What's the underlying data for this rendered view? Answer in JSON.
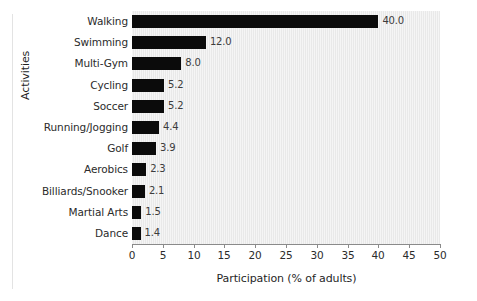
{
  "chart_data": {
    "type": "bar",
    "orientation": "horizontal",
    "title": "",
    "xlabel": "Participation (% of adults)",
    "ylabel": "Activities",
    "xlim": [
      0,
      50
    ],
    "xticks": [
      0,
      5,
      10,
      15,
      20,
      25,
      30,
      35,
      40,
      45,
      50
    ],
    "xtick_labels": [
      "0",
      "5",
      "10",
      "15",
      "20",
      "25",
      "30",
      "35",
      "40",
      "45",
      "50"
    ],
    "grid": false,
    "legend": null,
    "bar_color": "#0b0b0b",
    "plot_background": "#e9e9e9",
    "categories": [
      "Walking",
      "Swimming",
      "Multi-Gym",
      "Cycling",
      "Soccer",
      "Running/Jogging",
      "Golf",
      "Aerobics",
      "Billiards/Snooker",
      "Martial Arts",
      "Dance"
    ],
    "values": [
      40.0,
      12.0,
      8.0,
      5.2,
      5.2,
      4.4,
      3.9,
      2.3,
      2.1,
      1.5,
      1.4
    ],
    "value_labels": [
      "40.0",
      "12.0",
      "8.0",
      "5.2",
      "5.2",
      "4.4",
      "3.9",
      "2.3",
      "2.1",
      "1.5",
      "1.4"
    ]
  }
}
